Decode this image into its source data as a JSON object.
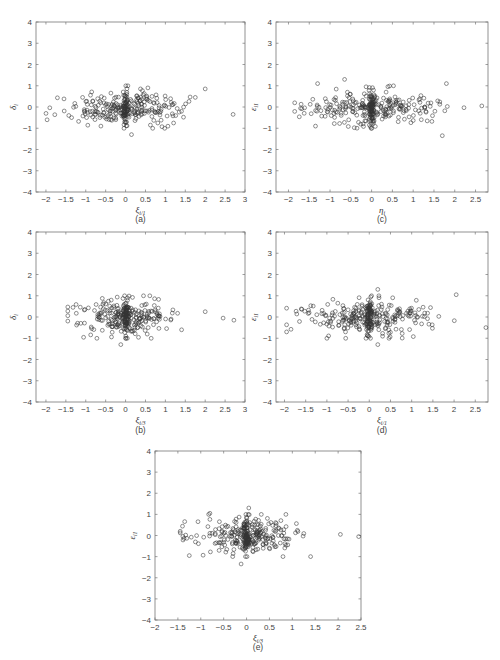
{
  "chart_data": [
    {
      "id": "a",
      "type": "scatter",
      "title": "",
      "panel_label": "(a)",
      "xlabel": "ξ",
      "xlabel_sub": "i/1",
      "ylabel": "δ",
      "ylabel_sub": "i",
      "xlim": [
        -2.25,
        3
      ],
      "ylim": [
        -4,
        4
      ],
      "xticks": [
        -2,
        -1.5,
        -1,
        -0.5,
        0,
        0.5,
        1,
        1.5,
        2,
        2.5,
        3
      ],
      "yticks": [
        -4,
        -3,
        -2,
        -1,
        0,
        1,
        2,
        3,
        4
      ],
      "marker": "open-circle",
      "grid": false,
      "seed": 11,
      "n_points": 300,
      "x_center": 0.0,
      "x_spread": 0.75,
      "x_min": -2.0,
      "x_max": 2.7,
      "y_center": -0.05,
      "y_spread": 0.38,
      "outliers": [
        [
          0.15,
          -1.3
        ],
        [
          2.0,
          0.85
        ],
        [
          -1.97,
          -0.6
        ],
        [
          2.7,
          -0.35
        ],
        [
          -0.62,
          -0.9
        ]
      ]
    },
    {
      "id": "b",
      "type": "scatter",
      "title": "",
      "panel_label": "(b)",
      "xlabel": "ξ",
      "xlabel_sub": "i/3",
      "ylabel": "δ",
      "ylabel_sub": "i",
      "xlim": [
        -2.25,
        3
      ],
      "ylim": [
        -4,
        4
      ],
      "xticks": [
        -2,
        -1.5,
        -1,
        -0.5,
        0,
        0.5,
        1,
        1.5,
        2,
        2.5,
        3
      ],
      "yticks": [
        -4,
        -3,
        -2,
        -1,
        0,
        1,
        2,
        3,
        4
      ],
      "marker": "open-circle",
      "grid": false,
      "seed": 23,
      "n_points": 300,
      "x_center": 0.0,
      "x_spread": 0.55,
      "x_min": -1.45,
      "x_max": 2.75,
      "y_center": 0.0,
      "y_spread": 0.38,
      "outliers": [
        [
          -0.12,
          -1.3
        ],
        [
          0.45,
          1.0
        ],
        [
          2.45,
          -0.05
        ],
        [
          2.72,
          -0.15
        ],
        [
          2.0,
          0.25
        ],
        [
          -1.45,
          0.28
        ]
      ]
    },
    {
      "id": "c",
      "type": "scatter",
      "title": "",
      "panel_label": "(c)",
      "xlabel": "η",
      "xlabel_sub": "i",
      "ylabel": "ε",
      "ylabel_sub": "i1",
      "xlim": [
        -2.3,
        2.8
      ],
      "ylim": [
        -4,
        4
      ],
      "xticks": [
        -2,
        -1.5,
        -1,
        -0.5,
        0,
        0.5,
        1,
        1.5,
        2,
        2.5
      ],
      "yticks": [
        -4,
        -3,
        -2,
        -1,
        0,
        1,
        2,
        3,
        4
      ],
      "marker": "open-circle",
      "grid": false,
      "seed": 37,
      "n_points": 320,
      "x_center": 0.0,
      "x_spread": 0.8,
      "x_min": -1.85,
      "x_max": 2.65,
      "y_center": -0.05,
      "y_spread": 0.42,
      "outliers": [
        [
          -0.65,
          1.3
        ],
        [
          1.7,
          -1.35
        ],
        [
          1.8,
          1.1
        ],
        [
          -1.3,
          1.1
        ],
        [
          -1.35,
          -0.9
        ],
        [
          2.65,
          0.05
        ]
      ]
    },
    {
      "id": "d",
      "type": "scatter",
      "title": "",
      "panel_label": "(d)",
      "xlabel": "ξ",
      "xlabel_sub": "i/1",
      "ylabel": "ε",
      "ylabel_sub": "i1",
      "xlim": [
        -2.2,
        2.8
      ],
      "ylim": [
        -4,
        4
      ],
      "xticks": [
        -2,
        -1.5,
        -1,
        -0.5,
        0,
        0.5,
        1,
        1.5,
        2,
        2.5
      ],
      "yticks": [
        -4,
        -3,
        -2,
        -1,
        0,
        1,
        2,
        3,
        4
      ],
      "marker": "open-circle",
      "grid": false,
      "seed": 53,
      "n_points": 320,
      "x_center": 0.0,
      "x_spread": 0.8,
      "x_min": -1.95,
      "x_max": 2.75,
      "y_center": 0.0,
      "y_spread": 0.42,
      "outliers": [
        [
          0.2,
          1.3
        ],
        [
          0.2,
          -1.3
        ],
        [
          2.05,
          1.05
        ],
        [
          -1.95,
          -0.7
        ],
        [
          -1.0,
          -1.0
        ],
        [
          2.75,
          -0.5
        ]
      ]
    },
    {
      "id": "e",
      "type": "scatter",
      "title": "",
      "panel_label": "(e)",
      "xlabel": "ξ",
      "xlabel_sub": "i/3",
      "ylabel": "ε",
      "ylabel_sub": "i1",
      "xlim": [
        -2,
        2.5
      ],
      "ylim": [
        -4,
        4
      ],
      "xticks": [
        -2,
        -1.5,
        -1,
        -0.5,
        0,
        0.5,
        1,
        1.5,
        2,
        2.5
      ],
      "yticks": [
        -4,
        -3,
        -2,
        -1,
        0,
        1,
        2,
        3,
        4
      ],
      "marker": "open-circle",
      "grid": false,
      "seed": 71,
      "n_points": 320,
      "x_center": 0.0,
      "x_spread": 0.55,
      "x_min": -1.45,
      "x_max": 2.45,
      "y_center": 0.0,
      "y_spread": 0.42,
      "outliers": [
        [
          0.05,
          1.3
        ],
        [
          -0.12,
          -1.35
        ],
        [
          2.45,
          -0.05
        ],
        [
          1.4,
          -1.0
        ],
        [
          -1.25,
          -0.95
        ],
        [
          -0.8,
          1.05
        ],
        [
          2.05,
          0.05
        ]
      ]
    }
  ]
}
